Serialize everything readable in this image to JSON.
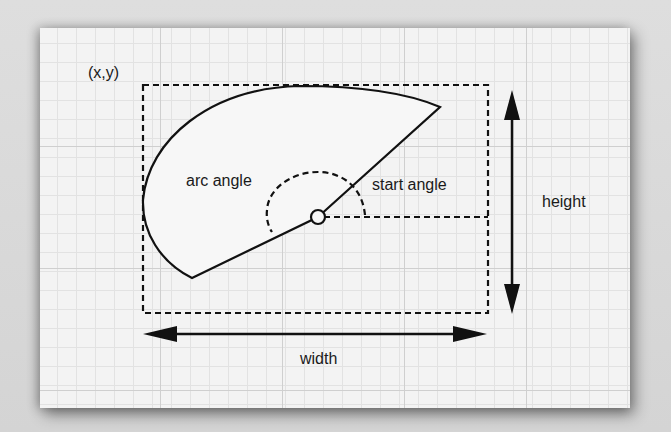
{
  "diagram": {
    "labels": {
      "origin": "(x,y)",
      "arc_angle": "arc angle",
      "start_angle": "start angle",
      "height": "height",
      "width": "width"
    },
    "colors": {
      "ink": "#111111",
      "paper": "#f3f3f3",
      "grid_major": "#cfcfcf",
      "grid_minor": "#e2e2e2"
    },
    "shapes": {
      "bounding_rect": "dashed",
      "arc": "solid pie wedge",
      "start_angle_marker": "dashed arc",
      "center": "small circle"
    }
  }
}
